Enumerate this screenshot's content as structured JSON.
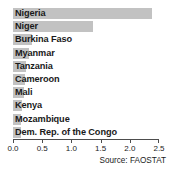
{
  "chart_data": {
    "type": "bar",
    "orientation": "horizontal",
    "title": "",
    "subtitle": "",
    "xlabel": "",
    "ylabel": "",
    "xlim": [
      0.0,
      2.5
    ],
    "ylim": null,
    "grid": false,
    "legend": null,
    "categories": [
      "Nigeria",
      "Niger",
      "Burkina Faso",
      "Myanmar",
      "Tanzania",
      "Cameroon",
      "Mali",
      "Kenya",
      "Mozambique",
      "Dem. Rep. of the Congo"
    ],
    "values": [
      2.38,
      1.37,
      0.33,
      0.28,
      0.22,
      0.2,
      0.19,
      0.16,
      0.14,
      0.13
    ],
    "tick_values": [
      0.0,
      0.5,
      1.0,
      1.5,
      2.0,
      2.5
    ],
    "tick_labels": [
      "0.0",
      "0.5",
      "1.0",
      "1.5",
      "2.0",
      "2.5"
    ],
    "bar_color": "#c2c2c2",
    "axis_color": "#4d4d4d",
    "text_color": "#1a1a1a",
    "annotations": [
      "Source: FAOSTAT"
    ]
  },
  "footer": {
    "source": "Source: FAOSTAT"
  }
}
